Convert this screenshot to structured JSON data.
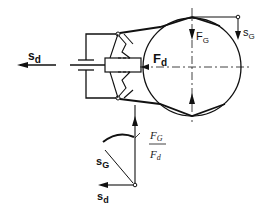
{
  "diagram": {
    "title": "",
    "labels": {
      "drive_displacement_left": {
        "base": "s",
        "sub": "d"
      },
      "drive_force": {
        "base": "F",
        "sub": "d"
      },
      "gripping_force": {
        "base": "F",
        "sub": "G"
      },
      "gripping_displacement": {
        "base": "s",
        "sub": "G"
      },
      "ratio_numerator": {
        "base": "F",
        "sub": "G"
      },
      "ratio_denominator": {
        "base": "F",
        "sub": "d"
      },
      "ratio_diagram_gripping_displacement": {
        "base": "s",
        "sub": "G"
      },
      "ratio_diagram_drive_displacement": {
        "base": "s",
        "sub": "d"
      }
    },
    "components": [
      "drive-rod",
      "piston-bracket",
      "slider-block",
      "toggle-links-upper",
      "toggle-links-lower",
      "gripper-jaw-upper",
      "gripper-jaw-lower",
      "workpiece-circle",
      "centerline-horizontal",
      "centerline-vertical",
      "ratio-curve"
    ],
    "colors": {
      "line": "#111111",
      "background": "#ffffff"
    }
  }
}
